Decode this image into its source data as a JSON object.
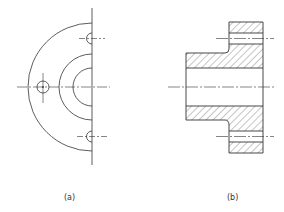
{
  "figure": {
    "views": [
      {
        "id": "a",
        "label": "(a)",
        "description": "half end view of flange"
      },
      {
        "id": "b",
        "label": "(b)",
        "description": "sectional view of flange"
      }
    ]
  },
  "colors": {
    "line": "#333333",
    "hatch": "#555555",
    "background": "#ffffff"
  }
}
